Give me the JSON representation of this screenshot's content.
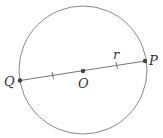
{
  "diagram": {
    "type": "circle-diameter",
    "labels": {
      "center": "O",
      "endpoint_left": "Q",
      "endpoint_right": "P",
      "radius": "r"
    },
    "colors": {
      "stroke": "#888888",
      "point": "#444444",
      "text": "#333333"
    }
  }
}
